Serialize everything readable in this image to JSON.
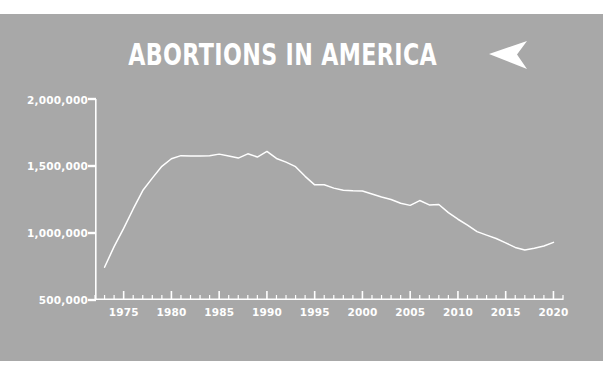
{
  "poster": {
    "background_color": "#a8a8a8",
    "ink_color": "#ffffff"
  },
  "header": {
    "title": "ABORTIONS IN AMERICA",
    "arrow_icon": "play-arrow-left-icon"
  },
  "chart_data": {
    "type": "line",
    "title": "ABORTIONS IN AMERICA",
    "xlabel": "",
    "ylabel": "",
    "xlim": [
      1972,
      2021
    ],
    "ylim": [
      500000,
      2000000
    ],
    "grid": false,
    "legend": null,
    "line_color": "#ffffff",
    "x_tick_labels": [
      "1975",
      "1980",
      "1985",
      "1990",
      "1995",
      "2000",
      "2005",
      "2010",
      "2015",
      "2020"
    ],
    "x_major_ticks": [
      1975,
      1980,
      1985,
      1990,
      1995,
      2000,
      2005,
      2010,
      2015,
      2020
    ],
    "x_minor_tick_interval": 1,
    "y_tick_labels": [
      "2,000,000",
      "1,500,000",
      "1,000,000",
      "500,000"
    ],
    "y_major_ticks": [
      2000000,
      1500000,
      1000000,
      500000
    ],
    "x": [
      1973,
      1974,
      1975,
      1976,
      1977,
      1978,
      1979,
      1980,
      1981,
      1982,
      1983,
      1984,
      1985,
      1986,
      1987,
      1988,
      1989,
      1990,
      1991,
      1992,
      1993,
      1994,
      1995,
      1996,
      1997,
      1998,
      1999,
      2000,
      2001,
      2002,
      2003,
      2004,
      2005,
      2006,
      2007,
      2008,
      2009,
      2010,
      2011,
      2012,
      2013,
      2014,
      2015,
      2016,
      2017,
      2018,
      2019,
      2020
    ],
    "values": [
      744600,
      898600,
      1034200,
      1179300,
      1316700,
      1409600,
      1497700,
      1553900,
      1577300,
      1573900,
      1575000,
      1577200,
      1588600,
      1574000,
      1559100,
      1590800,
      1566900,
      1608600,
      1556500,
      1528900,
      1495000,
      1423000,
      1359400,
      1360200,
      1335000,
      1319000,
      1314800,
      1313000,
      1291000,
      1269000,
      1250000,
      1222100,
      1206200,
      1242200,
      1209600,
      1212400,
      1152000,
      1102700,
      1058500,
      1010000,
      983900,
      958700,
      926200,
      892400,
      873500,
      886000,
      902500,
      930160
    ],
    "annotations": []
  }
}
